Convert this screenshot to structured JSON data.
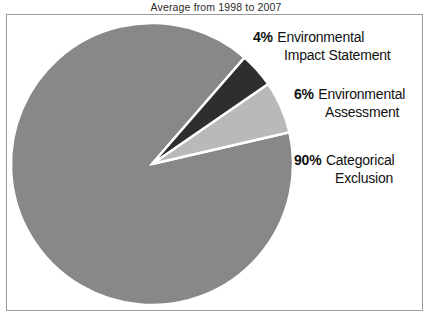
{
  "chart_data": {
    "type": "pie",
    "title": "Average from 1998 to 2007",
    "xlabel": "",
    "ylabel": "",
    "legend_position": "callout-labels-right",
    "grid": false,
    "categories": [
      "Environmental Impact Statement",
      "Environmental Assessment",
      "Categorical Exclusion"
    ],
    "values": [
      4,
      6,
      90
    ],
    "value_unit": "percent",
    "slices": [
      {
        "label_line_1": "Environmental",
        "label_line_2": "Impact Statement",
        "percent_text": "4%",
        "value": 4,
        "color": "#2e2e2e"
      },
      {
        "label_line_1": "Environmental",
        "label_line_2": "Assessment",
        "percent_text": "6%",
        "value": 6,
        "color": "#b9b9b9"
      },
      {
        "label_line_1": "Categorical",
        "label_line_2": "Exclusion",
        "percent_text": "90%",
        "value": 90,
        "color": "#888888"
      }
    ],
    "separator_color": "#ffffff",
    "frame_color": "#9b9b9b",
    "background_color": "#ffffff"
  },
  "chart": {
    "title": "Average from 1998 to 2007"
  },
  "callouts": {
    "eis": {
      "percent": "4%",
      "line_1": "Environmental",
      "line_2": "Impact Statement"
    },
    "ea": {
      "percent": "6%",
      "line_1": "Environmental",
      "line_2": "Assessment"
    },
    "ce": {
      "percent": "90%",
      "line_1": "Categorical",
      "line_2": "Exclusion"
    }
  }
}
